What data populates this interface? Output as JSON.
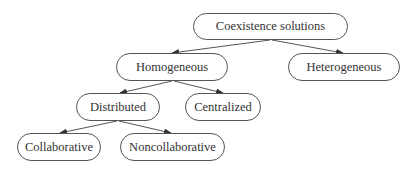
{
  "diagram": {
    "type": "tree",
    "nodes": [
      {
        "id": "root",
        "label": "Coexistence solutions",
        "x": 193,
        "y": 13,
        "w": 155,
        "h": 27
      },
      {
        "id": "homogeneous",
        "label": "Homogeneous",
        "x": 116,
        "y": 53,
        "w": 112,
        "h": 28
      },
      {
        "id": "heterogeneous",
        "label": "Heterogeneous",
        "x": 288,
        "y": 53,
        "w": 112,
        "h": 28
      },
      {
        "id": "distributed",
        "label": "Distributed",
        "x": 76,
        "y": 93,
        "w": 84,
        "h": 28
      },
      {
        "id": "centralized",
        "label": "Centralized",
        "x": 185,
        "y": 93,
        "w": 76,
        "h": 28
      },
      {
        "id": "collaborative",
        "label": "Collaborative",
        "x": 17,
        "y": 133,
        "w": 84,
        "h": 28
      },
      {
        "id": "noncollaborative",
        "label": "Noncollaborative",
        "x": 120,
        "y": 133,
        "w": 105,
        "h": 28
      }
    ],
    "edges": [
      {
        "from": "root",
        "to": "homogeneous",
        "x1": 270,
        "y1": 40,
        "x2": 172,
        "y2": 53
      },
      {
        "from": "root",
        "to": "heterogeneous",
        "x1": 272,
        "y1": 40,
        "x2": 343,
        "y2": 53
      },
      {
        "from": "homogeneous",
        "to": "distributed",
        "x1": 172,
        "y1": 81,
        "x2": 120,
        "y2": 93
      },
      {
        "from": "homogeneous",
        "to": "centralized",
        "x1": 174,
        "y1": 81,
        "x2": 223,
        "y2": 93
      },
      {
        "from": "distributed",
        "to": "collaborative",
        "x1": 117,
        "y1": 121,
        "x2": 60,
        "y2": 133
      },
      {
        "from": "distributed",
        "to": "noncollaborative",
        "x1": 119,
        "y1": 121,
        "x2": 171,
        "y2": 133
      }
    ],
    "colors": {
      "stroke": "#555555",
      "text": "#333333",
      "background": "#ffffff"
    }
  }
}
